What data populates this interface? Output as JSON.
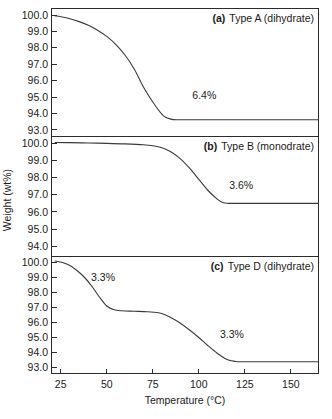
{
  "chart_data": [
    {
      "type": "line",
      "panel": "a",
      "panel_tag": "(a)",
      "panel_title": "Type A (dihydrate)",
      "title": "",
      "xlabel": "",
      "ylabel": "",
      "xlim": [
        20,
        165
      ],
      "ylim": [
        92.6,
        100.4
      ],
      "yticks": [
        "100.0",
        "99.0",
        "98.0",
        "97.0",
        "96.0",
        "95.0",
        "94.0",
        "93.0"
      ],
      "ytick_values": [
        100.0,
        99.0,
        98.0,
        97.0,
        96.0,
        95.0,
        94.0,
        93.0
      ],
      "grid": false,
      "legend": "none",
      "annotations": [
        {
          "text": "6.4%",
          "x": 103,
          "y": 95.1
        }
      ],
      "x": [
        22,
        25,
        30,
        35,
        40,
        45,
        50,
        55,
        60,
        65,
        70,
        75,
        80,
        83,
        86,
        90,
        100,
        110,
        120,
        130,
        140,
        150,
        160,
        165
      ],
      "values": [
        99.95,
        99.9,
        99.78,
        99.6,
        99.38,
        99.08,
        98.7,
        98.2,
        97.55,
        96.7,
        95.6,
        94.7,
        93.95,
        93.72,
        93.63,
        93.62,
        93.62,
        93.62,
        93.62,
        93.62,
        93.62,
        93.62,
        93.62,
        93.62
      ]
    },
    {
      "type": "line",
      "panel": "b",
      "panel_tag": "(b)",
      "panel_title": "Type B (monodrate)",
      "title": "",
      "xlabel": "",
      "ylabel": "",
      "xlim": [
        20,
        165
      ],
      "ylim": [
        93.4,
        100.4
      ],
      "yticks": [
        "100.0",
        "99.0",
        "98.0",
        "97.0",
        "96.0",
        "95.0",
        "94.0"
      ],
      "ytick_values": [
        100.0,
        99.0,
        98.0,
        97.0,
        96.0,
        95.0,
        94.0
      ],
      "grid": false,
      "legend": "none",
      "annotations": [
        {
          "text": "3.6%",
          "x": 123,
          "y": 97.55
        }
      ],
      "x": [
        22,
        30,
        40,
        50,
        60,
        70,
        75,
        80,
        85,
        90,
        95,
        100,
        105,
        110,
        113,
        116,
        120,
        130,
        140,
        150,
        160,
        165
      ],
      "values": [
        100.05,
        100.04,
        100.02,
        100.0,
        99.97,
        99.92,
        99.86,
        99.74,
        99.5,
        99.1,
        98.55,
        97.9,
        97.25,
        96.75,
        96.55,
        96.5,
        96.5,
        96.5,
        96.5,
        96.5,
        96.5,
        96.5
      ]
    },
    {
      "type": "line",
      "panel": "c",
      "panel_tag": "(c)",
      "panel_title": "Type D (dihydrate)",
      "title": "",
      "xlabel": "Temperature (°C)",
      "ylabel": "",
      "xlim": [
        20,
        165
      ],
      "ylim": [
        92.6,
        100.4
      ],
      "yticks": [
        "100.0",
        "99.0",
        "98.0",
        "97.0",
        "96.0",
        "95.0",
        "94.0",
        "93.0"
      ],
      "ytick_values": [
        100.0,
        99.0,
        98.0,
        97.0,
        96.0,
        95.0,
        94.0,
        93.0
      ],
      "grid": false,
      "legend": "none",
      "annotations": [
        {
          "text": "3.3%",
          "x": 48,
          "y": 99.0
        },
        {
          "text": "3.3%",
          "x": 118,
          "y": 95.2
        }
      ],
      "x": [
        22,
        26,
        30,
        34,
        38,
        42,
        46,
        50,
        54,
        58,
        65,
        72,
        78,
        82,
        86,
        90,
        95,
        100,
        105,
        110,
        115,
        120,
        124,
        128,
        135,
        145,
        155,
        165
      ],
      "values": [
        100.1,
        100.0,
        99.8,
        99.45,
        99.0,
        98.4,
        97.7,
        97.1,
        96.85,
        96.78,
        96.75,
        96.72,
        96.65,
        96.5,
        96.25,
        95.95,
        95.5,
        95.0,
        94.45,
        93.95,
        93.55,
        93.4,
        93.38,
        93.38,
        93.38,
        93.38,
        93.38,
        93.38
      ]
    }
  ],
  "axes": {
    "y_axis_label": "Weight (wt%)",
    "x_axis_label": "Temperature (°C)",
    "xticks": [
      "25",
      "50",
      "75",
      "100",
      "125",
      "150"
    ],
    "xtick_values": [
      25,
      50,
      75,
      100,
      125,
      150
    ]
  },
  "colors": {
    "curve": "#3a3a3a",
    "axis": "#2b2b2b",
    "text": "#1a1a1a",
    "background": "#ffffff"
  }
}
